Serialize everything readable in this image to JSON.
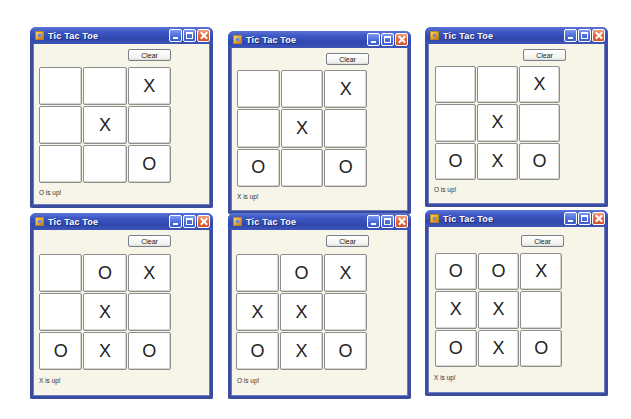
{
  "windows": [
    {
      "title": "Tic Tac Toe",
      "clear_label": "Clear",
      "cells": [
        "",
        "",
        "X",
        "",
        "X",
        "",
        "",
        "",
        "O"
      ],
      "status": "O is up!"
    },
    {
      "title": "Tic Tac Toe",
      "clear_label": "Clear",
      "cells": [
        "",
        "",
        "X",
        "",
        "X",
        "",
        "O",
        "",
        "O"
      ],
      "status": "X is up!"
    },
    {
      "title": "Tic Tac Toe",
      "clear_label": "Clear",
      "cells": [
        "",
        "",
        "X",
        "",
        "X",
        "",
        "O",
        "X",
        "O"
      ],
      "status": "O is up!"
    },
    {
      "title": "Tic Tac Toe",
      "clear_label": "Clear",
      "cells": [
        "",
        "O",
        "X",
        "",
        "X",
        "",
        "O",
        "X",
        "O"
      ],
      "status": "X is up!"
    },
    {
      "title": "Tic Tac Toe",
      "clear_label": "Clear",
      "cells": [
        "",
        "O",
        "X",
        "X",
        "X",
        "",
        "O",
        "X",
        "O"
      ],
      "status": "O is up!"
    },
    {
      "title": "Tic Tac Toe",
      "clear_label": "Clear",
      "cells": [
        "O",
        "O",
        "X",
        "X",
        "X",
        "",
        "O",
        "X",
        "O"
      ],
      "status": "X is up!"
    }
  ],
  "colors": {
    "titlebar": "#3c57c4",
    "window_border": "#3a4c9e",
    "client_bg": "#f6f5e8",
    "close_button": "#e2683c"
  }
}
